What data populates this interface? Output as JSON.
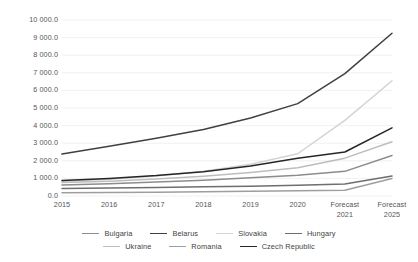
{
  "chart_data": {
    "type": "line",
    "title": "",
    "subtitle": "",
    "xlabel": "",
    "ylabel": "",
    "x": [
      "2015",
      "2016",
      "2017",
      "2018",
      "2019",
      "2020",
      "Forecast\n2021",
      "Forecast\n2025"
    ],
    "x_tick_labels": [
      "2015",
      "2016",
      "2017",
      "2018",
      "2019",
      "2020",
      "Forecast 2021",
      "Forecast 2025"
    ],
    "y_tick_labels": [
      "10 000.0",
      "9 000.0",
      "8 000.0",
      "7 000.0",
      "6 000.0",
      "5 000.0",
      "4 000.0",
      "3 000.0",
      "2 000.0",
      "1 000.0",
      "0.0"
    ],
    "y_tick_values": [
      10000,
      9000,
      8000,
      7000,
      6000,
      5000,
      4000,
      3000,
      2000,
      1000,
      0
    ],
    "ylim": [
      0,
      10000
    ],
    "grid": true,
    "grid_axis": "y",
    "legend_position": "bottom",
    "series": [
      {
        "name": "Bulgaria",
        "color": "#8c8c8c",
        "values": [
          620,
          700,
          790,
          900,
          1030,
          1180,
          1400,
          2300
        ]
      },
      {
        "name": "Belarus",
        "color": "#404040",
        "values": [
          2380,
          2830,
          3280,
          3780,
          4430,
          5250,
          6950,
          9250
        ]
      },
      {
        "name": "Slovakia",
        "color": "#d4d4d4",
        "values": [
          830,
          950,
          1130,
          1400,
          1800,
          2400,
          4300,
          6550
        ]
      },
      {
        "name": "Hungary",
        "color": "#6e6e6e",
        "values": [
          430,
          460,
          490,
          520,
          560,
          610,
          680,
          1130
        ]
      },
      {
        "name": "Ukraine",
        "color": "#bdbdbd",
        "values": [
          760,
          840,
          960,
          1120,
          1330,
          1600,
          2150,
          3080
        ]
      },
      {
        "name": "Romania",
        "color": "#9e9e9e",
        "values": [
          180,
          195,
          215,
          240,
          265,
          295,
          330,
          1000
        ]
      },
      {
        "name": "Czech Republic",
        "color": "#262626",
        "values": [
          880,
          1000,
          1160,
          1380,
          1700,
          2150,
          2500,
          3870
        ]
      }
    ]
  }
}
